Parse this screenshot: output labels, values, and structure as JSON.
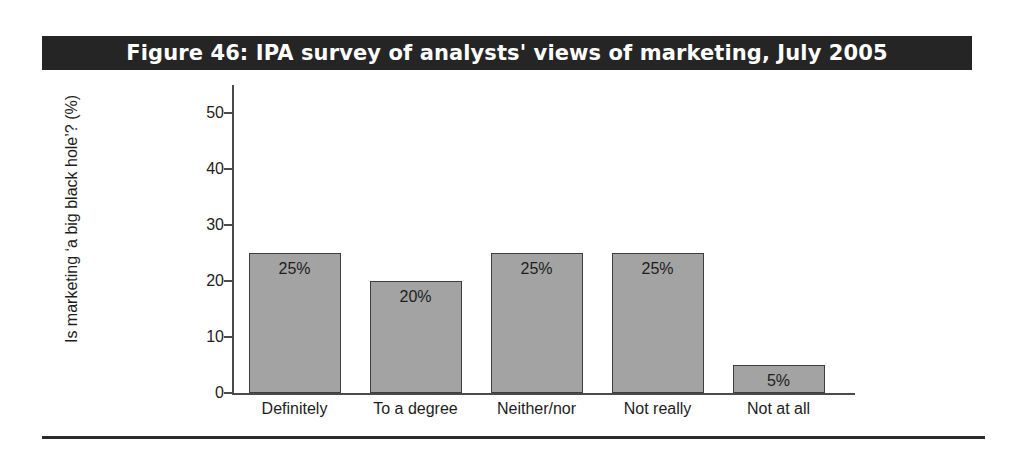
{
  "figure": {
    "title": "Figure 46: IPA survey of analysts' views of marketing, July 2005",
    "title_bar_color": "#252525",
    "title_text_color": "#ffffff",
    "rule_color": "#2a2a2a",
    "background": "#ffffff"
  },
  "chart_data": {
    "type": "bar",
    "title": "Figure 46: IPA survey of analysts' views of marketing, July 2005",
    "categories": [
      "Definitely",
      "To a degree",
      "Neither/nor",
      "Not really",
      "Not at all"
    ],
    "values": [
      25,
      20,
      25,
      25,
      5
    ],
    "data_labels": [
      "25%",
      "20%",
      "25%",
      "25%",
      "5%"
    ],
    "xlabel": "",
    "ylabel": "Is marketing ‘a big black hole’? (%)",
    "ylim": [
      0,
      50
    ],
    "yticks": [
      0,
      10,
      20,
      30,
      40,
      50
    ],
    "ytick_labels": [
      "0",
      "10",
      "20",
      "30",
      "40",
      "50"
    ],
    "grid": false,
    "legend": false,
    "bar_fill_color": "#a3a3a3",
    "bar_border_color": "#3d3d3d",
    "axis_color": "#4a4a4a"
  }
}
